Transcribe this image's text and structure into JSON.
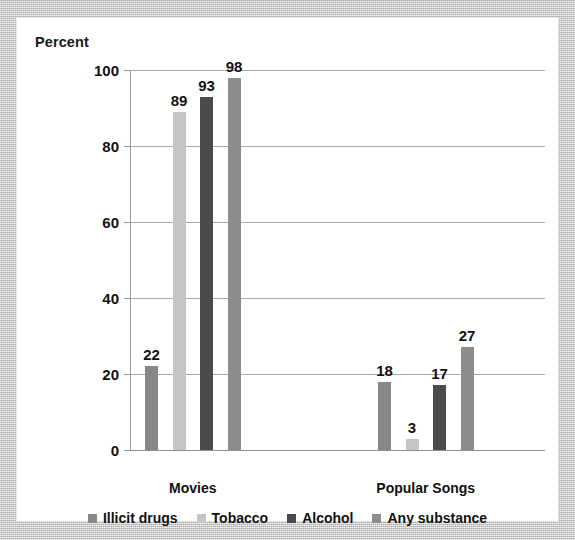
{
  "chart_data": {
    "type": "bar",
    "title": "",
    "subtitle": "",
    "xlabel": "",
    "ylabel": "Percent",
    "ylim": [
      0,
      100
    ],
    "yticks": [
      0,
      20,
      40,
      60,
      80,
      100
    ],
    "ytick_labels": [
      "0",
      "20",
      "40",
      "60",
      "80",
      "100"
    ],
    "grid": true,
    "legend_position": "bottom",
    "categories": [
      "Movies",
      "Popular Songs"
    ],
    "series": [
      {
        "name": "Illicit drugs",
        "color": "#878787",
        "values": [
          22,
          18
        ]
      },
      {
        "name": "Tobacco",
        "color": "#c6c6c6",
        "values": [
          89,
          3
        ]
      },
      {
        "name": "Alcohol",
        "color": "#4b4b4b",
        "values": [
          93,
          17
        ]
      },
      {
        "name": "Any substance",
        "color": "#8c8c8c",
        "values": [
          98,
          27
        ]
      }
    ],
    "data_labels": {
      "Movies": [
        "22",
        "89",
        "93",
        "98"
      ],
      "Popular Songs": [
        "18",
        "3",
        "17",
        "27"
      ]
    }
  },
  "axis": {
    "y_title": "Percent",
    "ticks": [
      {
        "label": "100",
        "value": 100
      },
      {
        "label": "80",
        "value": 80
      },
      {
        "label": "60",
        "value": 60
      },
      {
        "label": "40",
        "value": 40
      },
      {
        "label": "20",
        "value": 20
      },
      {
        "label": "0",
        "value": 0
      }
    ]
  },
  "groups": [
    {
      "label": "Movies",
      "bars": [
        {
          "series": "Illicit drugs",
          "value": 22,
          "label": "22",
          "color": "#878787"
        },
        {
          "series": "Tobacco",
          "value": 89,
          "label": "89",
          "color": "#c6c6c6"
        },
        {
          "series": "Alcohol",
          "value": 93,
          "label": "93",
          "color": "#4b4b4b"
        },
        {
          "series": "Any substance",
          "value": 98,
          "label": "98",
          "color": "#8c8c8c"
        }
      ]
    },
    {
      "label": "Popular Songs",
      "bars": [
        {
          "series": "Illicit drugs",
          "value": 18,
          "label": "18",
          "color": "#878787"
        },
        {
          "series": "Tobacco",
          "value": 3,
          "label": "3",
          "color": "#c6c6c6"
        },
        {
          "series": "Alcohol",
          "value": 17,
          "label": "17",
          "color": "#4b4b4b"
        },
        {
          "series": "Any substance",
          "value": 27,
          "label": "27",
          "color": "#8c8c8c"
        }
      ]
    }
  ],
  "legend": [
    {
      "label": "Illicit drugs",
      "color": "#878787"
    },
    {
      "label": "Tobacco",
      "color": "#c6c6c6"
    },
    {
      "label": "Alcohol",
      "color": "#4b4b4b"
    },
    {
      "label": "Any substance",
      "color": "#8c8c8c"
    }
  ]
}
